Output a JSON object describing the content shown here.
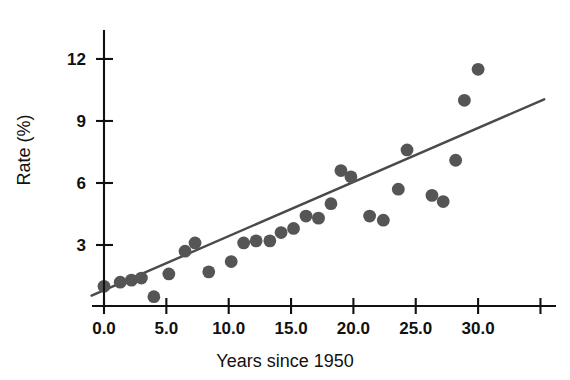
{
  "chart_data": {
    "type": "scatter",
    "title": "",
    "xlabel": "Years since 1950",
    "ylabel": "Rate (%)",
    "xlim": [
      -2.2,
      36.5
    ],
    "ylim": [
      -0.3,
      13.4
    ],
    "grid": false,
    "legend": "none",
    "xticks": [
      {
        "value": 0,
        "label": "0.0"
      },
      {
        "value": 5,
        "label": "5.0"
      },
      {
        "value": 10,
        "label": "10.0"
      },
      {
        "value": 15,
        "label": "15.0"
      },
      {
        "value": 20,
        "label": "20.0"
      },
      {
        "value": 25,
        "label": "25.0"
      },
      {
        "value": 30,
        "label": "30.0"
      },
      {
        "value": 35,
        "label": ""
      }
    ],
    "yticks": [
      {
        "value": 3,
        "label": "3"
      },
      {
        "value": 6,
        "label": "6"
      },
      {
        "value": 9,
        "label": "9"
      },
      {
        "value": 12,
        "label": "12"
      }
    ],
    "series": [
      {
        "name": "Rate",
        "marker": "circle",
        "color": "#555555",
        "points": [
          [
            0.0,
            1.0
          ],
          [
            1.3,
            1.2
          ],
          [
            2.2,
            1.3
          ],
          [
            3.0,
            1.4
          ],
          [
            4.0,
            0.5
          ],
          [
            5.2,
            1.6
          ],
          [
            6.5,
            2.7
          ],
          [
            7.3,
            3.1
          ],
          [
            8.4,
            1.7
          ],
          [
            10.2,
            2.2
          ],
          [
            11.2,
            3.1
          ],
          [
            12.2,
            3.2
          ],
          [
            13.3,
            3.2
          ],
          [
            14.2,
            3.6
          ],
          [
            15.2,
            3.8
          ],
          [
            16.2,
            4.4
          ],
          [
            17.2,
            4.3
          ],
          [
            18.2,
            5.0
          ],
          [
            19.0,
            6.6
          ],
          [
            19.8,
            6.3
          ],
          [
            21.3,
            4.4
          ],
          [
            22.4,
            4.2
          ],
          [
            23.6,
            5.7
          ],
          [
            24.3,
            7.6
          ],
          [
            26.3,
            5.4
          ],
          [
            27.2,
            5.1
          ],
          [
            28.2,
            7.1
          ],
          [
            28.9,
            10.0
          ],
          [
            30.0,
            11.5
          ]
        ]
      }
    ],
    "trend_line": {
      "name": "regression-line",
      "color": "#4a4a4a",
      "x_start": -1.0,
      "y_start": 0.55,
      "x_end": 35.3,
      "y_end": 10.05
    }
  }
}
